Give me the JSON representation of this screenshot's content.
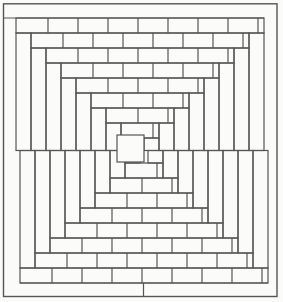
{
  "figure": {
    "background": "#fbfbfa",
    "line_color": "#565656",
    "line_width": 1.2,
    "canvas": {
      "width": 283,
      "height": 302
    },
    "border": {
      "x": 3.5,
      "y": 3.8,
      "width": 273.5,
      "height": 292.7,
      "line_width": 1.4
    },
    "pattern": {
      "unit": 15,
      "brick_width": 30,
      "rings": 8,
      "midline_y": 150.5,
      "joint_end_margin": 6,
      "top": {
        "left": 16,
        "right": 264,
        "first_course_y": 18,
        "joint_phase": 18
      },
      "bottom": {
        "left": 20,
        "right": 268,
        "first_course_bottom_y": 283,
        "joint_phase": 22
      },
      "top_margin_line": {
        "y": 18,
        "x1": 3.5,
        "x2": 264
      },
      "bottom_margin_line": {
        "y": 283,
        "x1": 20,
        "x2": 268
      },
      "bottom_margin_joint_x": 143.5,
      "keystone": {
        "x": 117,
        "y": 135,
        "size": 27
      }
    }
  }
}
